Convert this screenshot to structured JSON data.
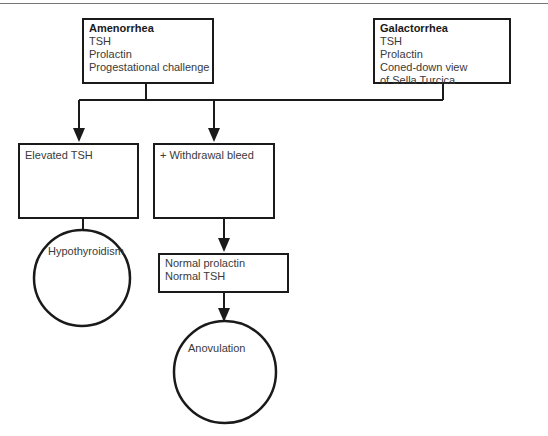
{
  "page": {
    "running_head": "...ology"
  },
  "diagram": {
    "type": "flowchart",
    "nodes": {
      "amenorrhea": {
        "shape": "rectangle",
        "title": "Amenorrhea",
        "lines": [
          "TSH",
          "Prolactin",
          "Progestational challenge"
        ]
      },
      "galactorrhea": {
        "shape": "rectangle",
        "title": "Galactorrhea",
        "lines": [
          "TSH",
          "Prolactin",
          "Coned-down view",
          "of Sella Turcica"
        ]
      },
      "elevated_tsh": {
        "shape": "rectangle",
        "lines": [
          "Elevated TSH"
        ]
      },
      "withdrawal_bleed": {
        "shape": "rectangle",
        "lines": [
          "+ Withdrawal bleed"
        ]
      },
      "normal": {
        "shape": "rectangle",
        "lines": [
          "Normal prolactin",
          "Normal TSH"
        ]
      },
      "hypothyroidism": {
        "shape": "circle",
        "label": "Hypothyroidism"
      },
      "anovulation": {
        "shape": "circle",
        "label": "Anovulation"
      }
    },
    "edges": [
      {
        "from": "amenorrhea",
        "to": "elevated_tsh"
      },
      {
        "from": "amenorrhea",
        "to": "withdrawal_bleed"
      },
      {
        "from": "galactorrhea",
        "to": "elevated_tsh"
      },
      {
        "from": "galactorrhea",
        "to": "withdrawal_bleed"
      },
      {
        "from": "elevated_tsh",
        "to": "hypothyroidism"
      },
      {
        "from": "withdrawal_bleed",
        "to": "normal"
      },
      {
        "from": "normal",
        "to": "anovulation"
      }
    ],
    "colors": {
      "stroke": "#1a1a1a",
      "text": "#3a3a3a",
      "background": "#ffffff"
    }
  }
}
